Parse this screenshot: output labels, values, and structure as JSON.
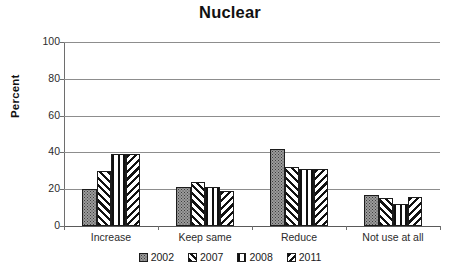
{
  "chart_data": {
    "type": "bar",
    "title": "Nuclear",
    "xlabel": "",
    "ylabel": "Percent",
    "ylim": [
      0,
      100
    ],
    "yticks": [
      0,
      20,
      40,
      60,
      80,
      100
    ],
    "grid": true,
    "legend_position": "bottom",
    "categories": [
      "Increase",
      "Keep same",
      "Reduce",
      "Not use at all"
    ],
    "series": [
      {
        "name": "2002",
        "pattern": "stipple-gray",
        "values": [
          20,
          21,
          42,
          17
        ]
      },
      {
        "name": "2007",
        "pattern": "diagonal-forward",
        "values": [
          30,
          24,
          32,
          15
        ]
      },
      {
        "name": "2008",
        "pattern": "vertical-lines",
        "values": [
          39,
          21,
          31,
          12
        ]
      },
      {
        "name": "2011",
        "pattern": "diagonal-backward",
        "values": [
          39,
          19,
          31,
          16
        ]
      }
    ]
  },
  "colors": {
    "gridline": "#8d8d8d",
    "axis": "#6e6e6e",
    "bar_outline": "#1c1c1c",
    "series_2002_fill": "#9b9b9b",
    "text": "#1a1a1a",
    "background": "#ffffff"
  }
}
